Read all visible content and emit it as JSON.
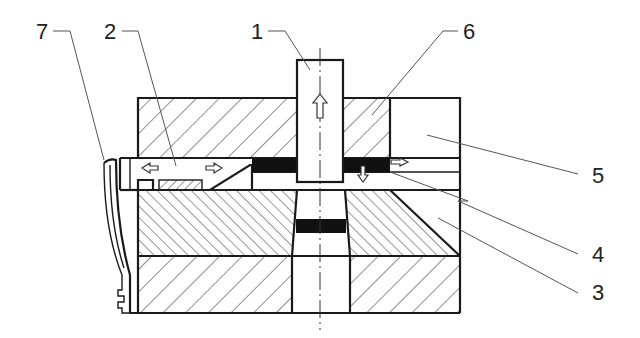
{
  "figure": {
    "type": "mechanical cross-section",
    "background": "#ffffff",
    "line_color": "#1a1a1a"
  },
  "labels": [
    {
      "id": "1",
      "text": "1",
      "points_to": "punch"
    },
    {
      "id": "2",
      "text": "2",
      "points_to": "slider"
    },
    {
      "id": "3",
      "text": "3",
      "points_to": "die"
    },
    {
      "id": "4",
      "text": "4",
      "points_to": "workpiece-strip"
    },
    {
      "id": "5",
      "text": "5",
      "points_to": "guide-block"
    },
    {
      "id": "6",
      "text": "6",
      "points_to": "stripper-plate"
    },
    {
      "id": "7",
      "text": "7",
      "points_to": "spring"
    }
  ],
  "arrows": [
    {
      "location": "punch",
      "direction": "up"
    },
    {
      "location": "slider",
      "direction": "left"
    },
    {
      "location": "slider",
      "direction": "right"
    },
    {
      "location": "strip-exit",
      "direction": "right"
    },
    {
      "location": "strip",
      "direction": "down"
    }
  ]
}
